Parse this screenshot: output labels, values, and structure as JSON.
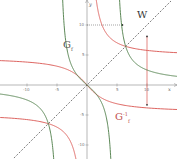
{
  "chart_data": {
    "type": "line",
    "title": "",
    "xlabel": "x",
    "ylabel": "y",
    "xlim": [
      -14.5,
      15
    ],
    "ylim": [
      -12.3,
      14.2
    ],
    "grid": false,
    "x_ticks": [
      -10,
      -5,
      5,
      10
    ],
    "y_ticks": [
      10,
      5,
      -5,
      -10
    ],
    "series": [
      {
        "name": "G_f",
        "color": "#4a7a44",
        "formula": "f(x) = 19.5*x/(x^2-22)",
        "asymptotes_x": [
          -4.7,
          4.7
        ]
      },
      {
        "name": "G_f^-1",
        "color": "#d9534f",
        "formula": "inverse of f (reflection of G_f across W)",
        "asymptotes_y": [
          -4.7,
          4.7
        ]
      },
      {
        "name": "W",
        "color": "#444444",
        "style": "dashed",
        "formula": "y = x"
      }
    ],
    "annotations": [
      {
        "text": "G_f",
        "x": -4.5,
        "y": 6.2
      },
      {
        "text": "G_f^-1",
        "x": 4.5,
        "y": -6.5
      },
      {
        "text": "W",
        "x": 6.2,
        "y": 10.5
      },
      {
        "type": "dotted-horizontal",
        "y": 10,
        "from_x": 0,
        "to_x": 5.9
      },
      {
        "type": "vertical-segment",
        "x": 10,
        "from_y": 8.1,
        "to_y": -3.3,
        "color": "#d9534f"
      }
    ]
  },
  "labels": {
    "g_f": "G",
    "g_f_sub": "f",
    "g_finv": "G",
    "g_finv_sup": "-1",
    "g_finv_sub": "f",
    "w": "W",
    "x_axis": "x",
    "y_axis": "y"
  },
  "ticks": {
    "x_neg10": "-10",
    "x_neg5": "-5",
    "x_pos5": "5",
    "x_pos10": "10",
    "y_pos10": "10",
    "y_pos5": "5",
    "y_neg5": "-5",
    "y_neg10": "-10"
  }
}
